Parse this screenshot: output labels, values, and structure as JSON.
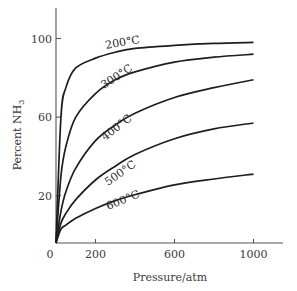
{
  "chart_data": {
    "type": "line",
    "title": "",
    "xlabel": "Pressure/atm",
    "ylabel": "Percent NH3",
    "ylabel_parts": {
      "main": "Percent NH",
      "subscript": "3"
    },
    "xlim": [
      0,
      1150
    ],
    "ylim": [
      0,
      118
    ],
    "x_ticks": [
      0,
      200,
      600,
      1000
    ],
    "x_tick_labels": [
      "0",
      "200",
      "600",
      "1000"
    ],
    "y_ticks": [
      20,
      60,
      100
    ],
    "y_tick_labels": [
      "20",
      "60",
      "100"
    ],
    "grid": false,
    "legend": "none (curves labeled inline)",
    "x": [
      0,
      25,
      50,
      100,
      200,
      300,
      400,
      600,
      800,
      1000
    ],
    "series": [
      {
        "name": "200°C",
        "label": "200°C",
        "values": [
          0,
          60,
          75,
          85,
          90,
          93,
          95,
          96.5,
          97.5,
          98
        ]
      },
      {
        "name": "300°C",
        "label": "300°C",
        "values": [
          0,
          30,
          45,
          60,
          72,
          79,
          83,
          88,
          90.5,
          92
        ]
      },
      {
        "name": "400°C",
        "label": "400°C",
        "values": [
          0,
          12,
          22,
          34,
          48,
          56,
          62,
          70,
          75,
          79
        ]
      },
      {
        "name": "500°C",
        "label": "500°C",
        "values": [
          0,
          6,
          11,
          18,
          28,
          35,
          41,
          49,
          54,
          57
        ]
      },
      {
        "name": "600°C",
        "label": "600°C",
        "values": [
          0,
          3,
          5,
          8.5,
          13.5,
          17.5,
          20.5,
          25.5,
          28.5,
          31
        ]
      }
    ]
  }
}
